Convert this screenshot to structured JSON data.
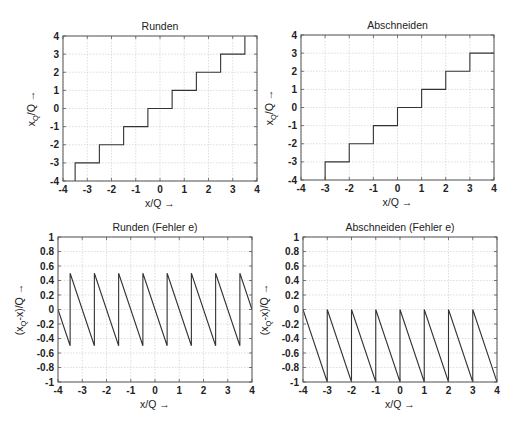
{
  "figure": {
    "background": "#ffffff",
    "line_color": "#333333",
    "grid_color": "#c8c8c8",
    "box_color": "#555555"
  },
  "chart_data": [
    {
      "id": "runden",
      "type": "line",
      "title": "Runden",
      "xlabel": "x/Q  →",
      "ylabel_main": "x",
      "ylabel_sub": "Q",
      "ylabel_rest": "/Q  →",
      "xlim": [
        -4,
        4
      ],
      "ylim": [
        -4,
        4
      ],
      "xticks": [
        -4,
        -3,
        -2,
        -1,
        0,
        1,
        2,
        3,
        4
      ],
      "yticks": [
        -4,
        -3,
        -2,
        -1,
        0,
        1,
        2,
        3,
        4
      ],
      "grid": true,
      "box": {
        "x": 63,
        "y": 36,
        "w": 194,
        "h": 145
      },
      "series": [
        {
          "name": "round(x/Q)",
          "x": [
            -3.5,
            -3.5,
            -2.5,
            -2.5,
            -1.5,
            -1.5,
            -0.5,
            -0.5,
            0.5,
            0.5,
            1.5,
            1.5,
            2.5,
            2.5,
            3.5,
            3.5
          ],
          "y": [
            -4,
            -3,
            -3,
            -2,
            -2,
            -1,
            -1,
            0,
            0,
            1,
            1,
            2,
            2,
            3,
            3,
            4
          ]
        }
      ]
    },
    {
      "id": "abschneiden",
      "type": "line",
      "title": "Abschneiden",
      "xlabel": "x/Q  →",
      "ylabel_main": "x",
      "ylabel_sub": "Q",
      "ylabel_rest": "/Q  →",
      "xlim": [
        -4,
        4
      ],
      "ylim": [
        -4,
        4
      ],
      "xticks": [
        -4,
        -3,
        -2,
        -1,
        0,
        1,
        2,
        3,
        4
      ],
      "yticks": [
        -4,
        -3,
        -2,
        -1,
        0,
        1,
        2,
        3,
        4
      ],
      "grid": true,
      "box": {
        "x": 301,
        "y": 35,
        "w": 193,
        "h": 145
      },
      "series": [
        {
          "name": "floor(x/Q)",
          "x": [
            -3,
            -3,
            -2,
            -2,
            -1,
            -1,
            0,
            0,
            1,
            1,
            2,
            2,
            3,
            3,
            4
          ],
          "y": [
            -4,
            -3,
            -3,
            -2,
            -2,
            -1,
            -1,
            0,
            0,
            1,
            1,
            2,
            2,
            3,
            3
          ]
        }
      ]
    },
    {
      "id": "runden-fehler",
      "type": "line",
      "title": "Runden (Fehler e)",
      "xlabel": "x/Q  →",
      "ylabel_main": "(x",
      "ylabel_sub": "Q",
      "ylabel_rest": "-x)/Q  →",
      "xlim": [
        -4,
        4
      ],
      "ylim": [
        -1,
        1
      ],
      "xticks": [
        -4,
        -3,
        -2,
        -1,
        0,
        1,
        2,
        3,
        4
      ],
      "yticks": [
        -1,
        -0.8,
        -0.6,
        -0.4,
        -0.2,
        0,
        0.2,
        0.4,
        0.6,
        0.8,
        1
      ],
      "grid": true,
      "box": {
        "x": 58,
        "y": 237,
        "w": 194,
        "h": 145
      },
      "series": [
        {
          "name": "e = round(x/Q) - x/Q",
          "x": [
            -4,
            -3.5,
            -3.5,
            -2.5,
            -2.5,
            -1.5,
            -1.5,
            -0.5,
            -0.5,
            0.5,
            0.5,
            1.5,
            1.5,
            2.5,
            2.5,
            3.5,
            3.5,
            4
          ],
          "y": [
            0,
            -0.5,
            0.5,
            -0.5,
            0.5,
            -0.5,
            0.5,
            -0.5,
            0.5,
            -0.5,
            0.5,
            -0.5,
            0.5,
            -0.5,
            0.5,
            -0.5,
            0.5,
            0
          ]
        }
      ]
    },
    {
      "id": "abschneiden-fehler",
      "type": "line",
      "title": "Abschneiden (Fehler e)",
      "xlabel": "x/Q  →",
      "ylabel_main": "(x",
      "ylabel_sub": "Q",
      "ylabel_rest": "-x)/Q  →",
      "xlim": [
        -4,
        4
      ],
      "ylim": [
        -1,
        1
      ],
      "xticks": [
        -4,
        -3,
        -2,
        -1,
        0,
        1,
        2,
        3,
        4
      ],
      "yticks": [
        -1,
        -0.8,
        -0.6,
        -0.4,
        -0.2,
        0,
        0.2,
        0.4,
        0.6,
        0.8,
        1
      ],
      "grid": true,
      "box": {
        "x": 303,
        "y": 237,
        "w": 194,
        "h": 145
      },
      "series": [
        {
          "name": "e = floor(x/Q) - x/Q",
          "x": [
            -4,
            -3,
            -3,
            -2,
            -2,
            -1,
            -1,
            0,
            0,
            1,
            1,
            2,
            2,
            3,
            3,
            4
          ],
          "y": [
            0,
            -1,
            0,
            -1,
            0,
            -1,
            0,
            -1,
            0,
            -1,
            0,
            -1,
            0,
            -1,
            0,
            -1
          ]
        }
      ]
    }
  ]
}
